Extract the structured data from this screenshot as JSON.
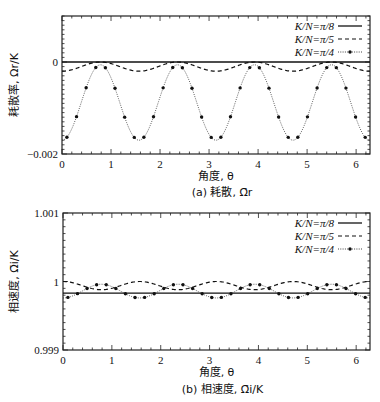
{
  "chart_data": [
    {
      "type": "line",
      "panel": "a",
      "caption": "(a) 耗散, Ω̄r",
      "xlabel": "角度, θ",
      "ylabel": "耗散率, Ωr/K",
      "xlim": [
        0,
        6.2832
      ],
      "ylim": [
        -0.002,
        0.001
      ],
      "xticks": [
        0,
        1,
        2,
        3,
        4,
        5,
        6
      ],
      "xtick_labels": [
        "0",
        "1",
        "2",
        "3",
        "4",
        "5",
        "6"
      ],
      "yticks": [
        -0.002,
        0
      ],
      "ytick_labels": [
        "−0.002",
        "0"
      ],
      "legend_position": "top-right",
      "grid": false,
      "series": [
        {
          "name": "K/N=π/8",
          "style": "solid",
          "model": {
            "mean": 0.0,
            "amp": 0.0,
            "period": 1.5708,
            "phase_min_at": 0
          }
        },
        {
          "name": "K/N=π/5",
          "style": "dashed",
          "model": {
            "mean": -0.0001,
            "amp": 0.0001,
            "period": 1.5708,
            "phase_min_at": 0
          }
        },
        {
          "name": "K/N=π/4",
          "style": "dotted-markers",
          "model": {
            "mean": -0.00088,
            "amp": 0.00082,
            "period": 1.5708,
            "phase_min_at": 0
          }
        }
      ]
    },
    {
      "type": "line",
      "panel": "b",
      "caption": "(b) 相速度, Ω̄i/K",
      "xlabel": "角度, θ",
      "ylabel": "相速度, Ω̄i/K",
      "xlim": [
        0,
        6.2832
      ],
      "ylim": [
        0.999,
        1.001
      ],
      "xticks": [
        0,
        1,
        2,
        3,
        4,
        5,
        6
      ],
      "xtick_labels": [
        "0",
        "1",
        "2",
        "3",
        "4",
        "5",
        "6"
      ],
      "yticks": [
        0.999,
        1,
        1.001
      ],
      "ytick_labels": [
        "0.999",
        "1",
        "1.001"
      ],
      "legend_position": "top-right",
      "grid": false,
      "series": [
        {
          "name": "K/N=π/8",
          "style": "solid",
          "model": {
            "mean": 0.99983,
            "amp": 0.0,
            "period": 1.5708,
            "phase_min_at": 0
          }
        },
        {
          "name": "K/N=π/5",
          "style": "dashed",
          "model": {
            "mean": 0.99994,
            "amp": 6e-05,
            "period": 1.5708,
            "phase_min_at": 0.7854
          }
        },
        {
          "name": "K/N=π/4",
          "style": "dotted-markers",
          "model": {
            "mean": 0.99986,
            "amp": 0.0001,
            "period": 1.5708,
            "phase_min_at": 0
          }
        }
      ]
    }
  ],
  "legend": {
    "entries": [
      "K/N=π/8",
      "K/N=π/5",
      "K/N=π/4"
    ]
  }
}
